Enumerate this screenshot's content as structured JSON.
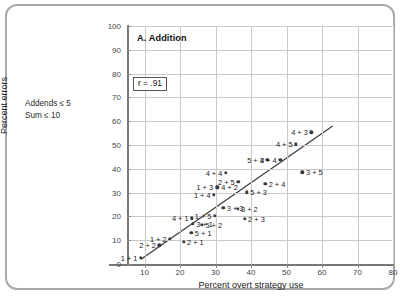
{
  "figure": {
    "side_note_line1": "Addends ≤ 5",
    "side_note_line2": "Sum ≤ 10"
  },
  "chart_data": {
    "type": "scatter",
    "title": "A. Addition",
    "xlabel": "Percent overt strategy use",
    "ylabel": "Percent errors",
    "xlim": [
      0,
      80
    ],
    "ylim": [
      0,
      100
    ],
    "xticks": [
      10,
      20,
      30,
      40,
      50,
      60,
      70,
      80
    ],
    "yticks": [
      0,
      10,
      20,
      30,
      40,
      50,
      60,
      70,
      80,
      90,
      100
    ],
    "grid": true,
    "legend": "none",
    "annotations": [
      {
        "text": "r = .91",
        "kind": "boxed-correlation",
        "x": 8,
        "y": 74
      }
    ],
    "trendline": {
      "kind": "linear-fit",
      "x_start": 9.0,
      "y_start": 2.0,
      "x_end": 63.0,
      "y_end": 58.0
    },
    "points": [
      {
        "label": "1 + 1",
        "x": 9.0,
        "y": 2.5,
        "side": "left"
      },
      {
        "label": "2 + 2",
        "x": 14.2,
        "y": 7.8,
        "side": "left"
      },
      {
        "label": "1 + 2",
        "x": 17.2,
        "y": 10.5,
        "side": "left"
      },
      {
        "label": "2 + 1",
        "x": 21.0,
        "y": 9.3,
        "side": "right"
      },
      {
        "label": "5 + 1",
        "x": 23.2,
        "y": 13.0,
        "side": "right"
      },
      {
        "label": "3 + 1",
        "x": 23.6,
        "y": 16.8,
        "side": "right"
      },
      {
        "label": "4 + 1",
        "x": 23.4,
        "y": 19.2,
        "side": "left"
      },
      {
        "label": "5 + 2",
        "x": 26.2,
        "y": 16.4,
        "side": "right"
      },
      {
        "label": "1 + 5",
        "x": 29.8,
        "y": 20.3,
        "side": "left"
      },
      {
        "label": "1 + 4",
        "x": 29.6,
        "y": 29.2,
        "side": "left"
      },
      {
        "label": "1 + 3",
        "x": 30.3,
        "y": 32.3,
        "side": "left"
      },
      {
        "label": "4 + 2",
        "x": 30.6,
        "y": 32.2,
        "side": "right"
      },
      {
        "label": "4 + 4",
        "x": 32.9,
        "y": 38.4,
        "side": "left"
      },
      {
        "label": "3 + 3",
        "x": 32.2,
        "y": 23.6,
        "side": "right"
      },
      {
        "label": "3 + 2",
        "x": 36.2,
        "y": 23.2,
        "side": "right"
      },
      {
        "label": "2 + 3",
        "x": 38.2,
        "y": 19.0,
        "side": "right"
      },
      {
        "label": "5 + 3",
        "x": 38.8,
        "y": 30.1,
        "side": "right"
      },
      {
        "label": "2 + 5",
        "x": 36.4,
        "y": 34.6,
        "side": "left"
      },
      {
        "label": "2 + 4",
        "x": 44.0,
        "y": 33.8,
        "side": "right"
      },
      {
        "label": "5 + 4",
        "x": 44.6,
        "y": 43.8,
        "side": "left"
      },
      {
        "label": "3 + 4",
        "x": 48.2,
        "y": 43.8,
        "side": "left"
      },
      {
        "label": "4 + 5",
        "x": 52.7,
        "y": 50.3,
        "side": "left"
      },
      {
        "label": "4 + 3",
        "x": 57.0,
        "y": 55.3,
        "side": "left"
      },
      {
        "label": "3 + 5",
        "x": 54.5,
        "y": 38.5,
        "side": "right"
      }
    ]
  }
}
